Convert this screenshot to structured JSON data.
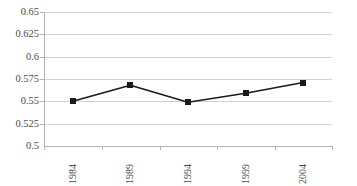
{
  "chart_data": {
    "type": "line",
    "title": "",
    "subtitle": "",
    "xlabel": "",
    "ylabel": "",
    "categories": [
      "1984",
      "1989",
      "1994",
      "1999",
      "2004"
    ],
    "series": [
      {
        "name": "",
        "values": [
          0.55,
          0.568,
          0.549,
          0.559,
          0.571
        ]
      }
    ],
    "ylim": [
      0.5,
      0.65
    ],
    "ytick_labels": [
      "0.65",
      "0.625",
      "0.6",
      "0.575",
      "0.55",
      "0.525",
      "0.5"
    ],
    "ytick_values": [
      0.65,
      0.625,
      0.6,
      0.575,
      0.55,
      0.525,
      0.5
    ],
    "grid": "horizontal",
    "legend": "none",
    "marker": "square",
    "colors": {
      "line": "#1a1a1a",
      "marker": "#1a1a1a",
      "gridline": "#d2d2d2",
      "axis": "#b4b4b4",
      "text": "#4a4a4a",
      "background": "#ffffff"
    }
  },
  "axes": {
    "y_labels": [
      "0.65",
      "0.625",
      "0.6",
      "0.575",
      "0.55",
      "0.525",
      "0.5"
    ],
    "x_labels": [
      "1984",
      "1989",
      "1994",
      "1999",
      "2004"
    ]
  },
  "caption": {
    "text": ""
  }
}
